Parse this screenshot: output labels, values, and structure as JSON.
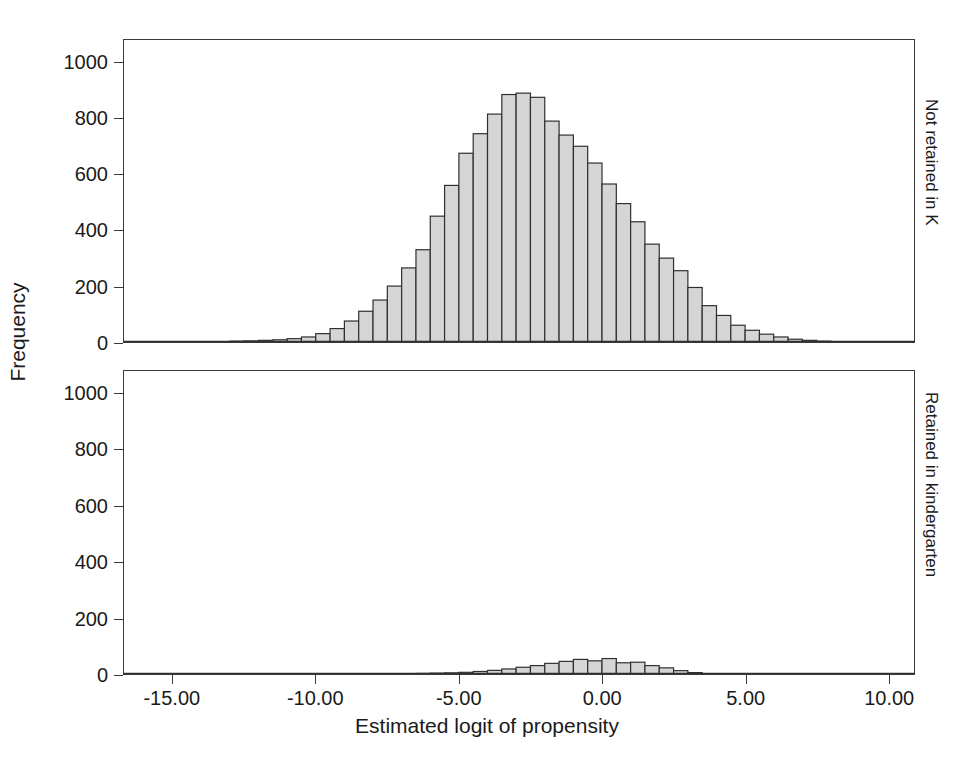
{
  "axes": {
    "y_title": "Frequency",
    "x_title": "Estimated logit of propensity",
    "y_ticks": [
      "0",
      "200",
      "400",
      "600",
      "800",
      "1000"
    ],
    "x_ticks": [
      "-15.00",
      "-10.00",
      "-5.00",
      "0.00",
      "5.00",
      "10.00"
    ]
  },
  "panels": {
    "top_label": "Not retained in K",
    "bottom_label": "Retained in kindergarten"
  },
  "style": {
    "bar_fill": "#d5d5d5",
    "bar_stroke": "#2f2f2f",
    "frame_stroke": "#3a3a3a",
    "text_color": "#1a1a1a",
    "background": "#ffffff"
  },
  "chart_data": {
    "type": "bar",
    "title": "",
    "subtitle": "",
    "xlabel": "Estimated logit of propensity",
    "ylabel": "Frequency",
    "xlim": [
      -16.7,
      10.9
    ],
    "ylim": [
      0,
      1080
    ],
    "grid": false,
    "legend": null,
    "bin_width": 0.5,
    "panel_layout": "two stacked panels sharing the x axis",
    "x_tick_values": [
      -15,
      -10,
      -5,
      0,
      5,
      10
    ],
    "y_tick_values": [
      0,
      200,
      400,
      600,
      800,
      1000
    ],
    "panels": [
      {
        "name": "Not retained in K",
        "strip_position": "right",
        "bin_centers": [
          -12.75,
          -12.25,
          -11.75,
          -11.25,
          -10.75,
          -10.25,
          -9.75,
          -9.25,
          -8.75,
          -8.25,
          -7.75,
          -7.25,
          -6.75,
          -6.25,
          -5.75,
          -5.25,
          -4.75,
          -4.25,
          -3.75,
          -3.25,
          -2.75,
          -2.25,
          -1.75,
          -1.25,
          -0.75,
          -0.25,
          0.25,
          0.75,
          1.25,
          1.75,
          2.25,
          2.75,
          3.25,
          3.75,
          4.25,
          4.75,
          5.25,
          5.75,
          6.25,
          6.75,
          7.25,
          7.75
        ],
        "values": [
          3,
          4,
          6,
          8,
          12,
          18,
          30,
          48,
          75,
          110,
          150,
          200,
          265,
          330,
          450,
          560,
          675,
          745,
          815,
          885,
          890,
          875,
          790,
          740,
          700,
          640,
          565,
          495,
          430,
          350,
          300,
          255,
          195,
          130,
          95,
          60,
          42,
          28,
          18,
          10,
          6,
          3
        ]
      },
      {
        "name": "Retained in kindergarten",
        "strip_position": "right",
        "bin_centers": [
          -6.25,
          -5.75,
          -5.25,
          -4.75,
          -4.25,
          -3.75,
          -3.25,
          -2.75,
          -2.25,
          -1.75,
          -1.25,
          -0.75,
          -0.25,
          0.25,
          0.75,
          1.25,
          1.75,
          2.25,
          2.75,
          3.25
        ],
        "values": [
          2,
          3,
          4,
          6,
          9,
          13,
          18,
          24,
          30,
          38,
          45,
          52,
          47,
          55,
          40,
          42,
          30,
          22,
          12,
          5
        ]
      }
    ]
  }
}
